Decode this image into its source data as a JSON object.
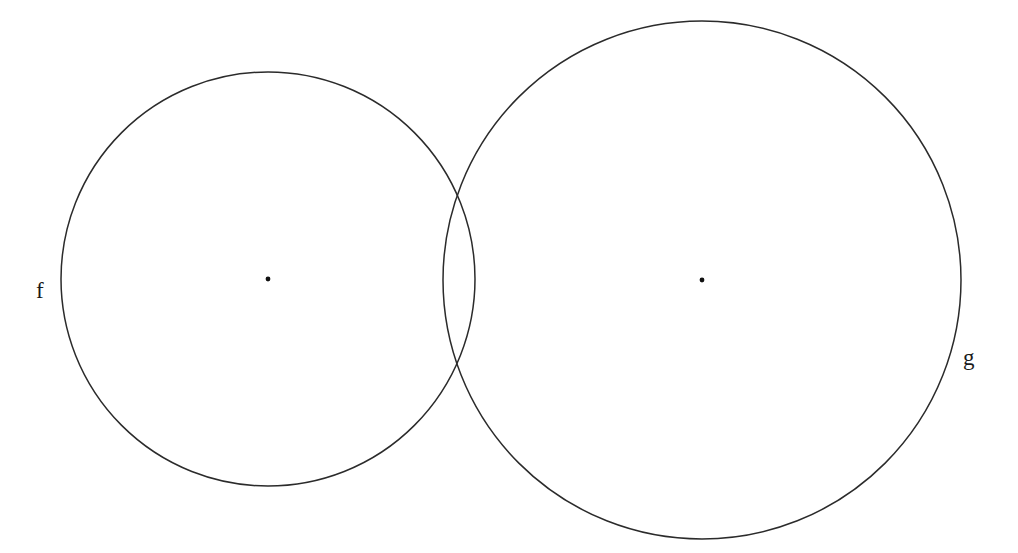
{
  "figure": {
    "type": "geometry-diagram",
    "background_color": "#ffffff",
    "stroke_color": "#2b2b2b",
    "dot_color": "#111111",
    "label_color": "#1a1a1a",
    "width": 1018,
    "height": 553
  },
  "shapes": {
    "circle_f": {
      "label": "f",
      "center_x": 268,
      "center_y": 279,
      "radius": 207,
      "center_dot_label": "",
      "label_x": 36,
      "label_y": 298
    },
    "circle_g": {
      "label": "g",
      "center_x": 702,
      "center_y": 280,
      "radius": 259,
      "center_dot_label": "",
      "label_x": 963,
      "label_y": 365
    }
  },
  "intersections": [
    {
      "name": "upper-intersection",
      "x": 460,
      "y": 183
    },
    {
      "name": "lower-intersection",
      "x": 460,
      "y": 375
    }
  ],
  "chart_data": {
    "type": "scatter",
    "xlabel": "",
    "ylabel": "",
    "grid": false,
    "legend": "none",
    "xlim": [
      0,
      1018
    ],
    "ylim": [
      0,
      553
    ],
    "series": [
      {
        "name": "f",
        "shape": "circle",
        "center": [
          268,
          279
        ],
        "radius": 207,
        "values": []
      },
      {
        "name": "g",
        "shape": "circle",
        "center": [
          702,
          280
        ],
        "radius": 259,
        "values": []
      }
    ],
    "annotations": [
      {
        "text": "f",
        "x": 36,
        "y": 298
      },
      {
        "text": "g",
        "x": 963,
        "y": 365
      }
    ],
    "points": [
      {
        "name": "center-f",
        "x": 268,
        "y": 279
      },
      {
        "name": "center-g",
        "x": 702,
        "y": 280
      },
      {
        "name": "upper-intersection",
        "x": 460,
        "y": 183
      },
      {
        "name": "lower-intersection",
        "x": 460,
        "y": 375
      }
    ]
  }
}
